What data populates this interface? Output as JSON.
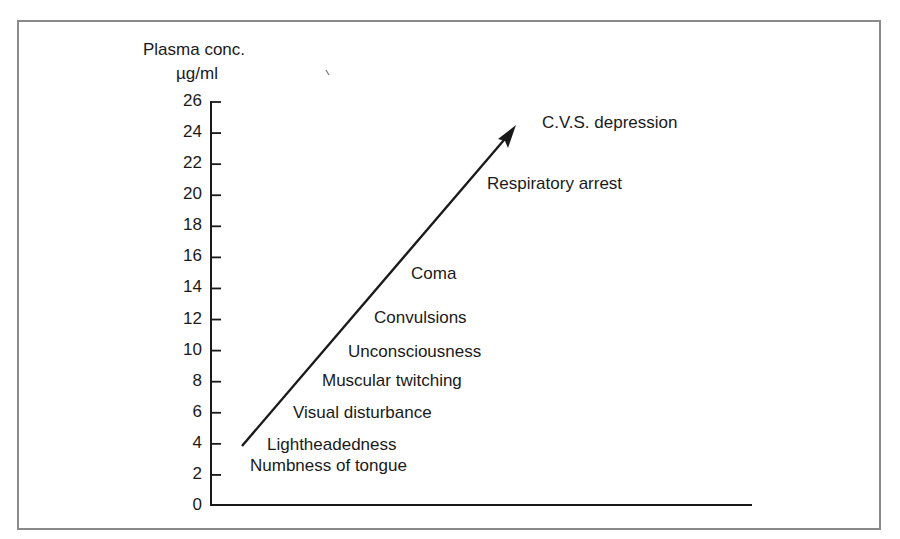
{
  "chart_data": {
    "type": "line",
    "title": "",
    "ylabel": "Plasma conc.",
    "yunit": "µg/ml",
    "xlabel": "",
    "ylim": [
      0,
      26
    ],
    "yticks": [
      "0",
      "2",
      "4",
      "6",
      "8",
      "10",
      "12",
      "14",
      "16",
      "18",
      "20",
      "22",
      "24",
      "26"
    ],
    "grid": false,
    "legend": null,
    "arrow": {
      "from_y": 4,
      "to_y": 24.5,
      "direction": "up-right"
    },
    "annotations": [
      {
        "label": "Numbness of tongue",
        "y": 3
      },
      {
        "label": "Lightheadedness",
        "y": 4
      },
      {
        "label": "Visual disturbance",
        "y": 6
      },
      {
        "label": "Muscular twitching",
        "y": 8
      },
      {
        "label": "Unconsciousness",
        "y": 10
      },
      {
        "label": "Convulsions",
        "y": 12
      },
      {
        "label": "Coma",
        "y": 15
      },
      {
        "label": "Respiratory arrest",
        "y": 21
      },
      {
        "label": "C.V.S. depression",
        "y": 25
      }
    ]
  },
  "axis": {
    "title_line1": "Plasma conc.",
    "title_line2": "µg/ml",
    "ticks": [
      "0",
      "2",
      "4",
      "6",
      "8",
      "10",
      "12",
      "14",
      "16",
      "18",
      "20",
      "22",
      "24",
      "26"
    ]
  },
  "effects": [
    "Numbness of tongue",
    "Lightheadedness",
    "Visual disturbance",
    "Muscular twitching",
    "Unconsciousness",
    "Convulsions",
    "Coma",
    "Respiratory arrest",
    "C.V.S. depression"
  ],
  "colors": {
    "ink": "#1a1a1a",
    "frame": "#8a8a8a",
    "background": "#ffffff"
  }
}
